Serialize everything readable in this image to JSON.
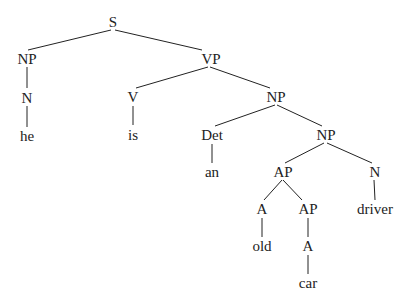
{
  "diagram": {
    "type": "syntax-tree",
    "sentence": "he is an old car driver",
    "nodes": [
      {
        "id": "S",
        "label": "S",
        "x": 113,
        "y": 27,
        "parent": null
      },
      {
        "id": "NP1",
        "label": "NP",
        "x": 27,
        "y": 64,
        "parent": "S"
      },
      {
        "id": "VP",
        "label": "VP",
        "x": 211,
        "y": 64,
        "parent": "S"
      },
      {
        "id": "N1",
        "label": "N",
        "x": 27,
        "y": 103,
        "parent": "NP1"
      },
      {
        "id": "he",
        "label": "he",
        "x": 27,
        "y": 141,
        "parent": "N1"
      },
      {
        "id": "V",
        "label": "V",
        "x": 133,
        "y": 102,
        "parent": "VP"
      },
      {
        "id": "is",
        "label": "is",
        "x": 133,
        "y": 140,
        "parent": "V"
      },
      {
        "id": "NP2",
        "label": "NP",
        "x": 276,
        "y": 102,
        "parent": "VP"
      },
      {
        "id": "Det",
        "label": "Det",
        "x": 212,
        "y": 140,
        "parent": "NP2"
      },
      {
        "id": "an",
        "label": "an",
        "x": 212,
        "y": 177,
        "parent": "Det"
      },
      {
        "id": "NP3",
        "label": "NP",
        "x": 326,
        "y": 140,
        "parent": "NP2"
      },
      {
        "id": "AP1",
        "label": "AP",
        "x": 283,
        "y": 177,
        "parent": "NP3"
      },
      {
        "id": "N2",
        "label": "N",
        "x": 375,
        "y": 177,
        "parent": "NP3"
      },
      {
        "id": "driver",
        "label": "driver",
        "x": 375,
        "y": 214,
        "parent": "N2"
      },
      {
        "id": "A1",
        "label": "A",
        "x": 262,
        "y": 214,
        "parent": "AP1"
      },
      {
        "id": "AP2",
        "label": "AP",
        "x": 308,
        "y": 214,
        "parent": "AP1"
      },
      {
        "id": "old",
        "label": "old",
        "x": 262,
        "y": 251,
        "parent": "A1"
      },
      {
        "id": "A2",
        "label": "A",
        "x": 308,
        "y": 251,
        "parent": "AP2"
      },
      {
        "id": "car",
        "label": "car",
        "x": 308,
        "y": 288,
        "parent": "A2"
      }
    ],
    "edges": [
      {
        "from": "S",
        "to": "NP1",
        "x1": 111,
        "y1": 30,
        "x2": 28,
        "y2": 50
      },
      {
        "from": "S",
        "to": "VP",
        "x1": 115,
        "y1": 30,
        "x2": 202,
        "y2": 50
      },
      {
        "from": "NP1",
        "to": "N1",
        "x1": 27,
        "y1": 67,
        "x2": 27,
        "y2": 88
      },
      {
        "from": "N1",
        "to": "he",
        "x1": 27,
        "y1": 106,
        "x2": 27,
        "y2": 127
      },
      {
        "from": "VP",
        "to": "V",
        "x1": 208,
        "y1": 67,
        "x2": 136,
        "y2": 88
      },
      {
        "from": "VP",
        "to": "NP2",
        "x1": 210,
        "y1": 67,
        "x2": 270,
        "y2": 88
      },
      {
        "from": "V",
        "to": "is",
        "x1": 133,
        "y1": 106,
        "x2": 133,
        "y2": 125
      },
      {
        "from": "NP2",
        "to": "Det",
        "x1": 275,
        "y1": 105,
        "x2": 215,
        "y2": 126
      },
      {
        "from": "NP2",
        "to": "NP3",
        "x1": 277,
        "y1": 105,
        "x2": 322,
        "y2": 126
      },
      {
        "from": "Det",
        "to": "an",
        "x1": 212,
        "y1": 144,
        "x2": 212,
        "y2": 163
      },
      {
        "from": "NP3",
        "to": "AP1",
        "x1": 324,
        "y1": 143,
        "x2": 285,
        "y2": 163
      },
      {
        "from": "NP3",
        "to": "N2",
        "x1": 327,
        "y1": 143,
        "x2": 372,
        "y2": 163
      },
      {
        "from": "N2",
        "to": "driver",
        "x1": 374,
        "y1": 180,
        "x2": 375,
        "y2": 200
      },
      {
        "from": "AP1",
        "to": "A1",
        "x1": 282,
        "y1": 180,
        "x2": 264,
        "y2": 200
      },
      {
        "from": "AP1",
        "to": "AP2",
        "x1": 283,
        "y1": 180,
        "x2": 302,
        "y2": 200
      },
      {
        "from": "A1",
        "to": "old",
        "x1": 262,
        "y1": 218,
        "x2": 262,
        "y2": 237
      },
      {
        "from": "AP2",
        "to": "A2",
        "x1": 308,
        "y1": 218,
        "x2": 308,
        "y2": 237
      },
      {
        "from": "A2",
        "to": "car",
        "x1": 308,
        "y1": 255,
        "x2": 308,
        "y2": 274
      }
    ]
  },
  "colors": {
    "background": "#ffffff",
    "ink": "#222222"
  }
}
